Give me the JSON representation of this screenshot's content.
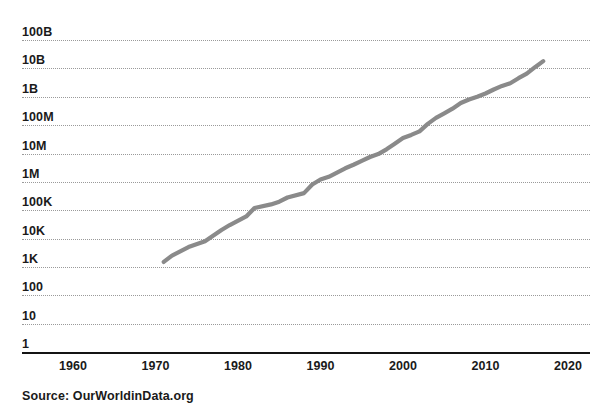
{
  "chart_data": {
    "type": "line",
    "title": "",
    "subtitle": "",
    "xlabel": "",
    "ylabel": "",
    "yscale": "log",
    "grid": true,
    "legend": false,
    "xlim": [
      1955,
      2021
    ],
    "ylim": [
      1,
      100000000000
    ],
    "x_ticks": [
      "1960",
      "1970",
      "1980",
      "1990",
      "2000",
      "2010",
      "2020"
    ],
    "x_tick_values": [
      1960,
      1970,
      1980,
      1990,
      2000,
      2010,
      2020
    ],
    "y_ticks": [
      "100B",
      "10B",
      "1B",
      "100M",
      "10M",
      "1M",
      "100K",
      "10K",
      "1K",
      "100",
      "10",
      "1"
    ],
    "y_tick_values": [
      100000000000,
      10000000000,
      1000000000,
      100000000,
      10000000,
      1000000,
      100000,
      10000,
      1000,
      100,
      10,
      1
    ],
    "series": [
      {
        "name": "Transistors per microprocessor",
        "color": "#8a8a8a",
        "line_width": 4.2,
        "x": [
          1971,
          1972,
          1974,
          1976,
          1978,
          1979,
          1981,
          1982,
          1984,
          1985,
          1986,
          1988,
          1989,
          1990,
          1991,
          1993,
          1994,
          1995,
          1996,
          1997,
          1998,
          1999,
          2000,
          2001,
          2002,
          2003,
          2004,
          2005,
          2006,
          2007,
          2008,
          2009,
          2010,
          2011,
          2012,
          2013,
          2014,
          2015,
          2016,
          2017
        ],
        "y": [
          1500,
          2500,
          5000,
          8000,
          20000,
          30000,
          60000,
          120000,
          160000,
          200000,
          280000,
          400000,
          800000,
          1200000,
          1500000,
          3000000,
          4000000,
          5500000,
          7500000,
          9500000,
          14000000,
          22000000,
          35000000,
          45000000,
          60000000,
          110000000,
          180000000,
          260000000,
          380000000,
          600000000,
          800000000,
          1000000000,
          1300000000,
          1800000000,
          2400000000,
          3000000000,
          4500000000,
          6500000000,
          11000000000,
          18000000000
        ]
      }
    ],
    "annotations": [],
    "source": "Source: OurWorldinData.org"
  },
  "axis": {
    "y_labels": [
      "100B",
      "10B",
      "1B",
      "100M",
      "10M",
      "1M",
      "100K",
      "10K",
      "1K",
      "100",
      "10",
      "1"
    ],
    "x_labels": [
      "1960",
      "1970",
      "1980",
      "1990",
      "2000",
      "2010",
      "2020"
    ]
  },
  "footer": {
    "source": "Source: OurWorldinData.org"
  },
  "colors": {
    "line": "#8a8a8a",
    "grid": "#9a9a9a",
    "axis": "#141414",
    "text": "#1a1a1a",
    "background": "#ffffff"
  }
}
